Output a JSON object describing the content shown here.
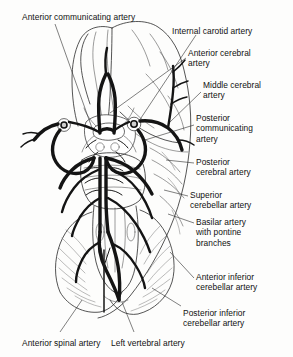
{
  "figure": {
    "background_color": "#fdfdfc",
    "ink_color": "#111111",
    "vessel_color": "#1a1a1a"
  },
  "labels": [
    {
      "id": "anterior-communicating-artery",
      "text": "Anterior communicating artery",
      "x": 22,
      "y": 12,
      "align": "left"
    },
    {
      "id": "internal-carotid-artery",
      "text": "Internal carotid artery",
      "x": 172,
      "y": 26,
      "align": "left"
    },
    {
      "id": "anterior-cerebral-artery",
      "text": "Anterior cerebral\nartery",
      "x": 188,
      "y": 48,
      "align": "left"
    },
    {
      "id": "middle-cerebral-artery",
      "text": "Middle cerebral\nartery",
      "x": 203,
      "y": 80,
      "align": "left"
    },
    {
      "id": "posterior-communicating-artery",
      "text": "Posterior\ncommunicating\nartery",
      "x": 196,
      "y": 113,
      "align": "left"
    },
    {
      "id": "posterior-cerebral-artery",
      "text": "Posterior\ncerebral artery",
      "x": 196,
      "y": 157,
      "align": "left"
    },
    {
      "id": "superior-cerebellar-artery",
      "text": "Superior\ncerebellar artery",
      "x": 190,
      "y": 190,
      "align": "left"
    },
    {
      "id": "basilar-artery-with-pontine-branches",
      "text": "Basilar artery\nwith pontine\nbranches",
      "x": 196,
      "y": 217,
      "align": "left"
    },
    {
      "id": "anterior-inferior-cerebellar-artery",
      "text": "Anterior inferior\ncerebellar artery",
      "x": 196,
      "y": 272,
      "align": "left"
    },
    {
      "id": "posterior-inferior-cerebellar-artery",
      "text": "Posterior inferior\ncerebellar artery",
      "x": 183,
      "y": 308,
      "align": "left"
    },
    {
      "id": "anterior-spinal-artery",
      "text": "Anterior spinal artery",
      "x": 22,
      "y": 338,
      "align": "left"
    },
    {
      "id": "left-vertebral-artery",
      "text": "Left vertebral artery",
      "x": 111,
      "y": 338,
      "align": "left"
    }
  ],
  "leader_lines": [
    {
      "id": "leader-anterior-communicating-artery",
      "points": "55,24 88,128"
    },
    {
      "id": "leader-internal-carotid-artery",
      "points": "196,35 120,140"
    },
    {
      "id": "leader-anterior-cerebral-artery",
      "points": "186,60 96,130"
    },
    {
      "id": "leader-middle-cerebral-artery",
      "points": "201,92 136,128"
    },
    {
      "id": "leader-posterior-communicating-artery",
      "points": "192,124 150,140"
    },
    {
      "id": "leader-posterior-cerebral-artery",
      "points": "192,163 166,158"
    },
    {
      "id": "leader-superior-cerebellar-artery",
      "points": "187,196 164,190"
    },
    {
      "id": "leader-basilar-artery",
      "points": "192,223 165,215"
    },
    {
      "id": "leader-anterior-inferior-cerebellar-artery",
      "points": "192,278 166,255"
    },
    {
      "id": "leader-posterior-inferior-cerebellar-artery",
      "points": "180,305 150,288"
    },
    {
      "id": "leader-anterior-spinal-artery",
      "points": "60,332 78,302"
    },
    {
      "id": "leader-left-vertebral-artery",
      "points": "132,332 122,304"
    }
  ]
}
